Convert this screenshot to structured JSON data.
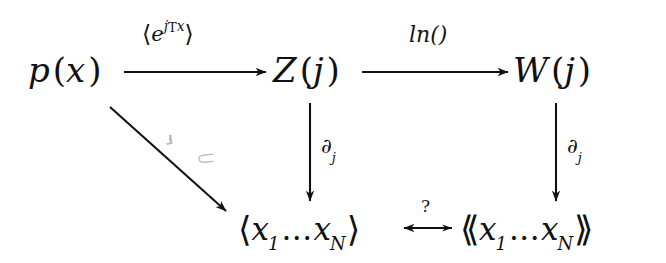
{
  "diagram": {
    "background_color": "#ffffff",
    "ink_color": "#111111",
    "faint_ink_color": "#b9b9b9",
    "nodes": [
      {
        "id": "p-of-x",
        "label": "p (x)",
        "base": "p",
        "paren_open": "(",
        "arg": "x",
        "paren_close": ")",
        "position": "top-left"
      },
      {
        "id": "z-of-j",
        "label": "Z (j)",
        "base": "Z",
        "paren_open": "(",
        "arg": "j",
        "paren_close": ")",
        "position": "top-center"
      },
      {
        "id": "w-of-j",
        "label": "W (j)",
        "base": "W",
        "paren_open": "(",
        "arg": "j",
        "paren_close": ")",
        "position": "top-right"
      },
      {
        "id": "moments",
        "label": "⟨x₁...x_N⟩",
        "bracket_open": "⟨",
        "var": "x",
        "sub_first": "1",
        "dots": "...",
        "var2": "x",
        "sub_last": "N",
        "bracket_close": "⟩",
        "position": "bottom-center"
      },
      {
        "id": "cumulants",
        "label": "⟪ x₁...x_N ⟫",
        "bracket_open": "⟪",
        "var": "x",
        "sub_first": "1",
        "dots": "...",
        "var2": "x",
        "sub_last": "N",
        "bracket_close": "⟫",
        "position": "bottom-right"
      }
    ],
    "edges": [
      {
        "id": "p-to-z",
        "from": "p-of-x",
        "to": "z-of-j",
        "kind": "arrow-right",
        "label": "⟨e^{j^T x}⟩",
        "label_bracket_open": "⟨",
        "label_base": "e",
        "label_sup_j": "j",
        "label_sup_T": "T",
        "label_sup_x": "x",
        "label_bracket_close": "⟩"
      },
      {
        "id": "z-to-w",
        "from": "z-of-j",
        "to": "w-of-j",
        "kind": "arrow-right",
        "label": "ln()"
      },
      {
        "id": "z-to-moments",
        "from": "z-of-j",
        "to": "moments",
        "kind": "arrow-down",
        "label": "∂_j",
        "label_base": "∂",
        "label_sub": "j"
      },
      {
        "id": "w-to-cumulants",
        "from": "w-of-j",
        "to": "cumulants",
        "kind": "arrow-down",
        "label": "∂_j",
        "label_base": "∂",
        "label_sub": "j"
      },
      {
        "id": "p-to-moments",
        "from": "p-of-x",
        "to": "moments",
        "kind": "arrow-diagonal",
        "label": "⟨ ⟩",
        "label_faded": true,
        "label_open": "⸥",
        "label_close": "⸦"
      },
      {
        "id": "moments-to-cumulants",
        "from": "moments",
        "to": "cumulants",
        "kind": "arrow-bidirectional",
        "label": "?"
      }
    ]
  }
}
